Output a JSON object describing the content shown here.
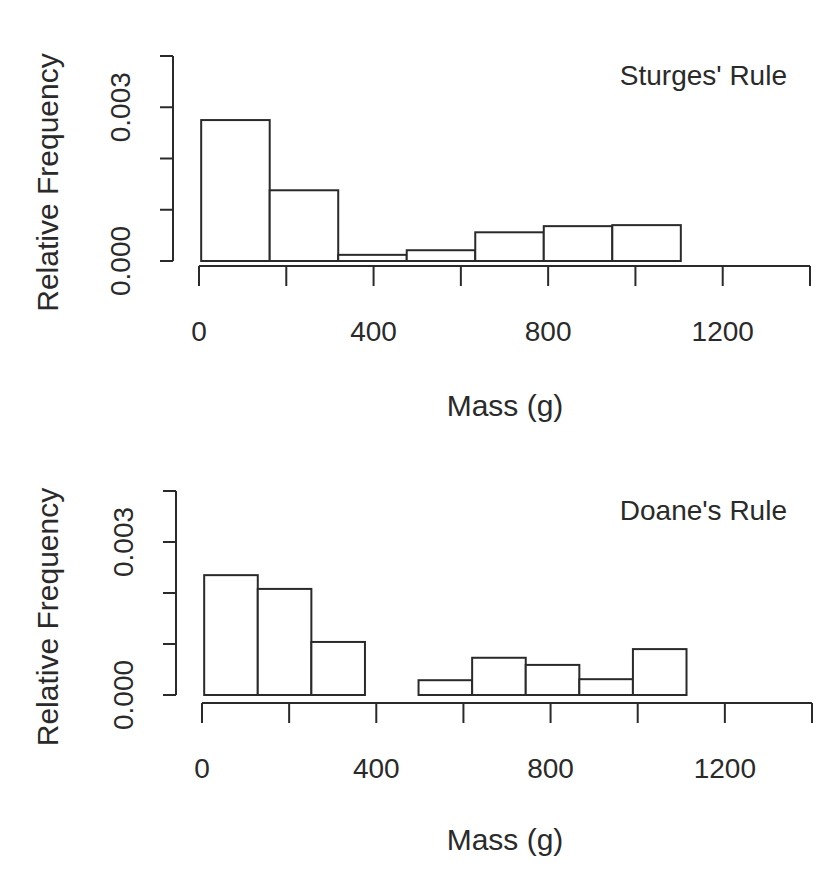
{
  "figure": {
    "clipped_header_text": "",
    "stroke_color": "#2a2a2a",
    "background": "#ffffff"
  },
  "chart_data": [
    {
      "type": "bar",
      "subtype": "histogram",
      "title": "Sturges' Rule",
      "legend_position": "top-right",
      "xlabel": "Mass (g)",
      "ylabel": "Relative Frequency",
      "xlim": [
        0,
        1400
      ],
      "ylim": [
        0,
        0.004
      ],
      "x_ticks": [
        0,
        200,
        400,
        600,
        800,
        1000,
        1200,
        1400
      ],
      "x_tick_labels": [
        "0",
        "400",
        "800",
        "1200"
      ],
      "x_tick_label_values": [
        0,
        400,
        800,
        1200
      ],
      "y_ticks": [
        0,
        0.001,
        0.002,
        0.003,
        0.004
      ],
      "y_tick_labels": [
        "0.000",
        "0.003"
      ],
      "y_tick_label_values": [
        0,
        0.003
      ],
      "grid": false,
      "bin_edges": [
        5,
        162,
        319,
        476,
        633,
        790,
        947,
        1104
      ],
      "values": [
        0.00275,
        0.00138,
        0.00012,
        0.00021,
        0.00056,
        0.00068,
        0.0007
      ]
    },
    {
      "type": "bar",
      "subtype": "histogram",
      "title": "Doane's Rule",
      "legend_position": "top-right",
      "xlabel": "Mass (g)",
      "ylabel": "Relative Frequency",
      "xlim": [
        0,
        1400
      ],
      "ylim": [
        0,
        0.004
      ],
      "x_ticks": [
        0,
        200,
        400,
        600,
        800,
        1000,
        1200,
        1400
      ],
      "x_tick_labels": [
        "0",
        "400",
        "800",
        "1200"
      ],
      "x_tick_label_values": [
        0,
        400,
        800,
        1200
      ],
      "y_ticks": [
        0,
        0.001,
        0.002,
        0.003,
        0.004
      ],
      "y_tick_labels": [
        "0.000",
        "0.003"
      ],
      "y_tick_label_values": [
        0,
        0.003
      ],
      "grid": false,
      "bin_edges": [
        5,
        128,
        251,
        374,
        497,
        620,
        743,
        866,
        989,
        1112
      ],
      "values": [
        0.00235,
        0.00208,
        0.00104,
        0.0,
        0.00029,
        0.00073,
        0.00059,
        0.00031,
        0.0009
      ]
    }
  ]
}
